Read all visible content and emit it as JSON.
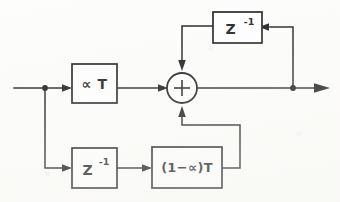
{
  "diagram": {
    "type": "signal-flow-block-diagram",
    "background_color": "#fdfdfb",
    "line_color": "#17181a",
    "blocks": [
      {
        "id": "gain_alpha_t",
        "label": "∝ T",
        "x": 72,
        "y": 64,
        "w": 45,
        "h": 39
      },
      {
        "id": "delay_top",
        "label": "Z",
        "exponent": "-1",
        "x": 213,
        "y": 12,
        "w": 49,
        "h": 31
      },
      {
        "id": "delay_bottom",
        "label": "Z",
        "exponent": "-1",
        "x": 72,
        "y": 148,
        "w": 45,
        "h": 40
      },
      {
        "id": "gain_one_minus_alpha_t",
        "label": "(1−∝)T",
        "x": 152,
        "y": 147,
        "w": 70,
        "h": 41
      }
    ],
    "summing_junction": {
      "id": "summer",
      "symbol": "+",
      "cx": 182,
      "cy": 88,
      "r": 15,
      "inputs": [
        "left",
        "top",
        "bottom"
      ],
      "output": "right"
    },
    "nodes": [
      {
        "id": "input-branch-node",
        "cx": 45,
        "cy": 88
      },
      {
        "id": "output-branch-node",
        "cx": 293,
        "cy": 88
      }
    ],
    "ports": [
      {
        "id": "input-port",
        "x": 14,
        "y": 88,
        "direction": "in"
      },
      {
        "id": "output-port",
        "x": 328,
        "y": 88,
        "direction": "out"
      }
    ],
    "signal_paths": [
      {
        "id": "input-to-branch",
        "from": "input-port",
        "to": "input-branch-node"
      },
      {
        "id": "branch-to-gain-alpha",
        "from": "input-branch-node",
        "to": "gain_alpha_t"
      },
      {
        "id": "gain-alpha-to-summer",
        "from": "gain_alpha_t",
        "to": "summer"
      },
      {
        "id": "summer-to-output",
        "from": "summer",
        "to": "output-port"
      },
      {
        "id": "output-feedback-up",
        "from": "output-branch-node",
        "to": "delay_top"
      },
      {
        "id": "delay-top-to-summer",
        "from": "delay_top",
        "to": "summer"
      },
      {
        "id": "branch-down-to-delay",
        "from": "input-branch-node",
        "to": "delay_bottom"
      },
      {
        "id": "delay-bottom-to-gain",
        "from": "delay_bottom",
        "to": "gain_one_minus_alpha_t"
      },
      {
        "id": "gain-to-summer-bottom",
        "from": "gain_one_minus_alpha_t",
        "to": "summer"
      }
    ]
  }
}
